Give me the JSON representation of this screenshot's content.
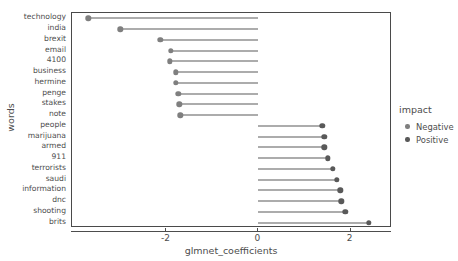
{
  "chart_data": {
    "type": "scatter",
    "subtype": "lollipop",
    "title": "",
    "xlabel": "glmnet_coefficients",
    "ylabel": "words",
    "xlim": [
      -4.05,
      2.9
    ],
    "xticks": [
      -2,
      0,
      2
    ],
    "xtick_labels": [
      "-2",
      "0",
      "2"
    ],
    "grid": false,
    "baseline": 0,
    "categories": [
      "technology",
      "india",
      "brexit",
      "email",
      "4100",
      "business",
      "hermine",
      "penge",
      "stakes",
      "note",
      "people",
      "marijuana",
      "armed",
      "911",
      "terrorists",
      "saudi",
      "information",
      "dnc",
      "shooting",
      "brits"
    ],
    "values": [
      -3.7,
      -3.0,
      -2.13,
      -1.91,
      -1.93,
      -1.8,
      -1.8,
      -1.74,
      -1.72,
      -1.7,
      1.39,
      1.43,
      1.43,
      1.5,
      1.61,
      1.7,
      1.78,
      1.8,
      1.89,
      2.39
    ],
    "impact": [
      "Negative",
      "Negative",
      "Negative",
      "Negative",
      "Negative",
      "Negative",
      "Negative",
      "Negative",
      "Negative",
      "Negative",
      "Positive",
      "Positive",
      "Positive",
      "Positive",
      "Positive",
      "Positive",
      "Positive",
      "Positive",
      "Positive",
      "Positive"
    ],
    "legend": {
      "title": "impact",
      "position": "right",
      "entries": [
        {
          "label": "Negative",
          "color": "#7f7f7f"
        },
        {
          "label": "Positive",
          "color": "#595959"
        }
      ]
    },
    "colors": {
      "negative": "#7f7f7f",
      "positive": "#595959",
      "segment": "#5a5a5a",
      "axis": "#4d4d4d",
      "panel_border": "#4a4a4a",
      "background": "#ffffff"
    }
  }
}
